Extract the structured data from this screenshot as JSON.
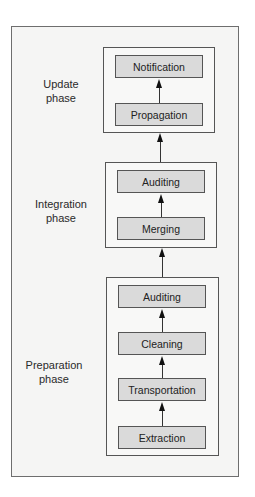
{
  "diagram": {
    "phases": [
      {
        "label_line1": "Update",
        "label_line2": "phase",
        "steps": [
          "Notification",
          "Propagation"
        ]
      },
      {
        "label_line1": "Integration",
        "label_line2": "phase",
        "steps": [
          "Auditing",
          "Merging"
        ]
      },
      {
        "label_line1": "Preparation",
        "label_line2": "phase",
        "steps": [
          "Auditing",
          "Cleaning",
          "Transportation",
          "Extraction"
        ]
      }
    ],
    "flow_direction": "bottom-to-top"
  },
  "colors": {
    "panel_bg": "#f5f5f4",
    "step_fill": "#dadada",
    "border": "#555555"
  }
}
